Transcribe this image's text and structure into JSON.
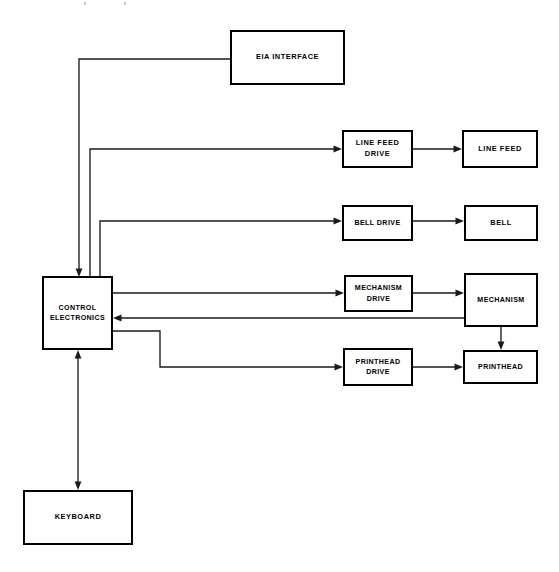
{
  "diagram": {
    "line_color": "#1a1a1a",
    "box_border_color": "#000000",
    "background_color": "#ffffff",
    "nodes": [
      {
        "id": "eia-interface",
        "label": "EIA INTERFACE",
        "x": 230,
        "y": 30,
        "w": 115,
        "h": 55
      },
      {
        "id": "line-feed-drive",
        "label": "LINE FEED\nDRIVE",
        "x": 342,
        "y": 130,
        "w": 71,
        "h": 38
      },
      {
        "id": "line-feed",
        "label": "LINE FEED",
        "x": 462,
        "y": 130,
        "w": 76,
        "h": 38
      },
      {
        "id": "bell-drive",
        "label": "BELL DRIVE",
        "x": 342,
        "y": 205,
        "w": 71,
        "h": 36
      },
      {
        "id": "bell",
        "label": "BELL",
        "x": 464,
        "y": 205,
        "w": 74,
        "h": 36
      },
      {
        "id": "control-electronics",
        "label": "CONTROL\nELECTRONICS",
        "x": 42,
        "y": 276,
        "w": 71,
        "h": 74
      },
      {
        "id": "mechanism-drive",
        "label": "MECHANISM\nDRIVE",
        "x": 344,
        "y": 275,
        "w": 69,
        "h": 37
      },
      {
        "id": "mechanism",
        "label": "MECHANISM",
        "x": 464,
        "y": 273,
        "w": 74,
        "h": 54
      },
      {
        "id": "printhead-drive",
        "label": "PRINTHEAD\nDRIVE",
        "x": 343,
        "y": 348,
        "w": 70,
        "h": 38
      },
      {
        "id": "printhead",
        "label": "PRINTHEAD",
        "x": 463,
        "y": 350,
        "w": 75,
        "h": 34
      },
      {
        "id": "keyboard",
        "label": "KEYBOARD",
        "x": 23,
        "y": 490,
        "w": 110,
        "h": 55
      }
    ],
    "connections": [
      {
        "id": "eia-to-control",
        "from": "eia-interface",
        "to": "control-electronics",
        "direction": "one-way"
      },
      {
        "id": "control-to-line-feed-drive",
        "from": "control-electronics",
        "to": "line-feed-drive",
        "direction": "one-way"
      },
      {
        "id": "line-feed-drive-to-line-feed",
        "from": "line-feed-drive",
        "to": "line-feed",
        "direction": "one-way"
      },
      {
        "id": "control-to-bell-drive",
        "from": "control-electronics",
        "to": "bell-drive",
        "direction": "one-way"
      },
      {
        "id": "bell-drive-to-bell",
        "from": "bell-drive",
        "to": "bell",
        "direction": "one-way"
      },
      {
        "id": "control-to-mechanism-drive",
        "from": "control-electronics",
        "to": "mechanism-drive",
        "direction": "one-way"
      },
      {
        "id": "mechanism-drive-to-mechanism",
        "from": "mechanism-drive",
        "to": "mechanism",
        "direction": "one-way"
      },
      {
        "id": "mechanism-to-control",
        "from": "mechanism",
        "to": "control-electronics",
        "direction": "one-way"
      },
      {
        "id": "control-to-printhead-drive",
        "from": "control-electronics",
        "to": "printhead-drive",
        "direction": "one-way"
      },
      {
        "id": "printhead-drive-to-printhead",
        "from": "printhead-drive",
        "to": "printhead",
        "direction": "one-way"
      },
      {
        "id": "mechanism-to-printhead",
        "from": "mechanism",
        "to": "printhead",
        "direction": "one-way"
      },
      {
        "id": "keyboard-control-link",
        "from": "keyboard",
        "to": "control-electronics",
        "direction": "two-way"
      }
    ]
  }
}
